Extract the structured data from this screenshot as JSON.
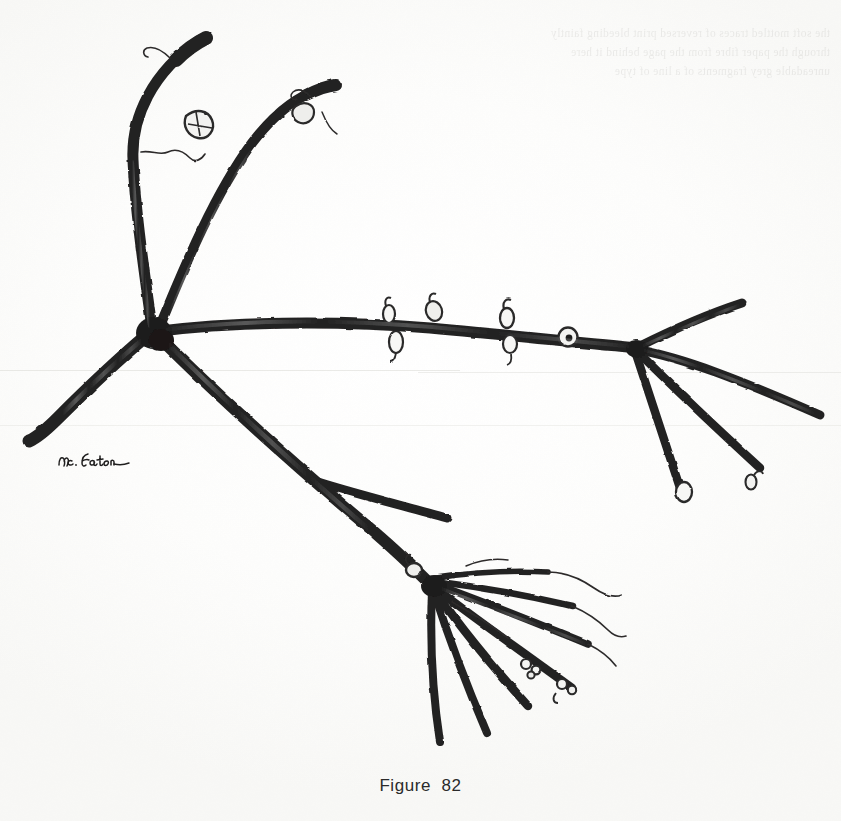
{
  "page": {
    "width": 841,
    "height": 821,
    "background_color": "#fcfcfb",
    "ink_color": "#232323",
    "kind": "scanned-botanical-illustration"
  },
  "caption": {
    "text": "Figure 82",
    "label": "Figure",
    "number": "82"
  },
  "signature": {
    "text": "Mc. Eaton",
    "reading": "handwritten artist signature, lower left, reads approximately \"Mc. Eaton\""
  },
  "ghost_text": {
    "note": "illegible show-through bleed from the reverse side of the page, top margin",
    "lines": [
      "the soft mottled traces of reversed print bleeding faintly",
      "through the paper fibre from the page behind it here",
      "unreadable grey fragments of a line of type"
    ]
  },
  "artwork": {
    "title": "Figure 82",
    "subject": "branching plant stem / rhizome with buds, scales and fine tendrils",
    "medium": "ink drawing reproduced as a halftone scan",
    "parts": [
      {
        "name": "central-junction-node",
        "description": "thick dark node at left-centre where five branches meet",
        "x": 150,
        "y": 330
      },
      {
        "name": "upper-left-shoot",
        "description": "long shoot curving up and left to a blunt tip with scales and wavy tendrils",
        "tip_x": 200,
        "tip_y": 36
      },
      {
        "name": "upper-middle-shoot",
        "description": "shoot arcing up and right to a tip with small scale appendages",
        "tip_x": 333,
        "tip_y": 86
      },
      {
        "name": "left-stem",
        "description": "short tapering stem running down-left to a rounded blunt end",
        "tip_x": 28,
        "tip_y": 440
      },
      {
        "name": "main-horizontal-stem",
        "description": "long stem running right from the central node, bearing oval buds above and below",
        "start_x": 150,
        "start_y": 330,
        "end_x": 640,
        "end_y": 345
      },
      {
        "name": "right-fan-node",
        "description": "node on the right from which four to five slender branches fan out",
        "x": 636,
        "y": 347
      },
      {
        "name": "lower-diagonal-stem",
        "description": "stout stem descending right from the central node to the lower whorl",
        "start_x": 165,
        "start_y": 345,
        "end_x": 432,
        "end_y": 585
      },
      {
        "name": "lower-whorl-node",
        "description": "dense whorl of branches and thread-like tendrils at the lower right",
        "x": 432,
        "y": 588
      }
    ],
    "buds": [
      {
        "name": "bud-above-stem-1",
        "x": 389,
        "y": 314,
        "position": "above stem"
      },
      {
        "name": "bud-below-stem-1",
        "x": 396,
        "y": 341,
        "position": "below stem"
      },
      {
        "name": "bud-above-stem-2",
        "x": 434,
        "y": 310,
        "position": "above stem"
      },
      {
        "name": "bud-above-stem-3",
        "x": 507,
        "y": 317,
        "position": "above stem"
      },
      {
        "name": "bud-below-stem-2",
        "x": 510,
        "y": 343,
        "position": "below stem"
      },
      {
        "name": "ringed-node",
        "x": 568,
        "y": 336,
        "position": "on stem, dark centred ring"
      },
      {
        "name": "bud-right-fan-lower",
        "x": 684,
        "y": 492,
        "position": "branch tip"
      },
      {
        "name": "bud-right-fan-outer",
        "x": 751,
        "y": 482,
        "position": "branch tip"
      },
      {
        "name": "bud-lower-whorl-1",
        "x": 530,
        "y": 667,
        "position": "lower branch"
      },
      {
        "name": "bud-lower-whorl-2",
        "x": 566,
        "y": 686,
        "position": "lower branch"
      },
      {
        "name": "bud-lower-whorl-top",
        "x": 414,
        "y": 572,
        "position": "above whorl node"
      }
    ]
  }
}
